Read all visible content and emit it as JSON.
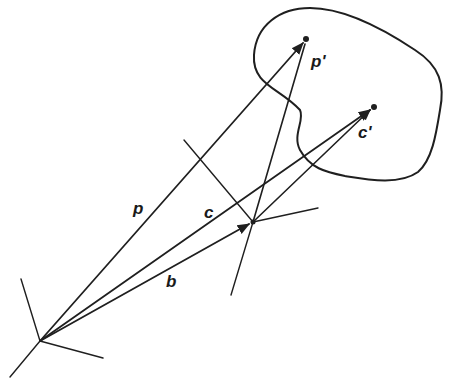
{
  "diagram": {
    "type": "vector-geometry",
    "ink_color": "#1f1f1f",
    "background": "#ffffff",
    "labels": {
      "p": "p",
      "c": "c",
      "b": "b",
      "p_prime": "p'",
      "c_prime": "c'"
    },
    "points": {
      "world_origin": [
        40,
        341
      ],
      "body_origin": [
        253,
        222
      ],
      "p_prime": [
        306,
        39
      ],
      "c_prime": [
        374,
        107
      ]
    },
    "vectors": [
      {
        "name": "p",
        "from": "world_origin",
        "to": "p_prime"
      },
      {
        "name": "c",
        "from": "world_origin",
        "to": "c_prime"
      },
      {
        "name": "b",
        "from": "world_origin",
        "to": "body_origin"
      },
      {
        "name": "p_local",
        "from": "body_origin",
        "to": "p_prime"
      },
      {
        "name": "c_local",
        "from": "body_origin",
        "to": "c_prime"
      }
    ],
    "frames": [
      {
        "name": "world-frame",
        "origin": "world_origin"
      },
      {
        "name": "body-frame",
        "origin": "body_origin"
      }
    ],
    "shapes": [
      {
        "name": "rigid-body-outline",
        "kind": "closed-curve"
      }
    ]
  }
}
